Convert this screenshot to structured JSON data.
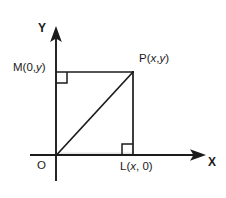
{
  "figure": {
    "type": "coordinate-geometry-diagram",
    "background_color": "#ffffff",
    "stroke_color": "#1b1b1b"
  },
  "axes": {
    "y_axis": {
      "label": "Y",
      "arrow": "up",
      "x_px": 56,
      "from_y_px": 180,
      "to_y_px": 27
    },
    "x_axis": {
      "label": "X",
      "arrow": "right",
      "y_px": 155,
      "from_x_px": 30,
      "to_x_px": 205
    },
    "origin": {
      "label": "O",
      "x_px": 56,
      "y_px": 155
    }
  },
  "points": [
    {
      "id": "M",
      "label": "M",
      "coords": "(0, y)",
      "coord_x": "0",
      "coord_y": "y",
      "x_px": 56,
      "y_px": 72
    },
    {
      "id": "P",
      "label": "P",
      "coords": "(x, y)",
      "coord_x": "x",
      "coord_y": "y",
      "x_px": 133,
      "y_px": 72
    },
    {
      "id": "L",
      "label": "L",
      "coords": "(x, 0)",
      "coord_x": "x",
      "coord_y": "0",
      "x_px": 133,
      "y_px": 155
    },
    {
      "id": "O",
      "label": "O",
      "coords": "",
      "coord_x": "0",
      "coord_y": "0",
      "x_px": 56,
      "y_px": 155
    }
  ],
  "labels": {
    "y_axis": "Y",
    "x_axis": "X",
    "origin": "O",
    "m_name": "M",
    "m_open": "(0,",
    "m_var": "y",
    "m_close": ")",
    "p_name": "P",
    "p_open": "(",
    "p_var_x": "x",
    "p_comma": ",",
    "p_var_y": "y",
    "p_close": ")",
    "l_name": "L",
    "l_open": "(",
    "l_var_x": "x",
    "l_close": ", 0)"
  },
  "segments": [
    {
      "name": "MP",
      "from": "M",
      "to": "P",
      "style": "solid"
    },
    {
      "name": "PL",
      "from": "P",
      "to": "L",
      "style": "solid"
    },
    {
      "name": "OP",
      "from": "O",
      "to": "P",
      "style": "solid",
      "note": "hypotenuse / diagonal"
    }
  ],
  "right_angle_marks": [
    {
      "at": "M",
      "size_px": 11
    },
    {
      "at": "L",
      "size_px": 11
    }
  ]
}
